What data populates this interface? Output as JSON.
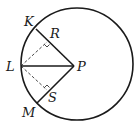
{
  "diagram": {
    "type": "geometry",
    "colors": {
      "stroke": "#1a1a1a",
      "background": "#ffffff"
    },
    "points": {
      "K": {
        "label": "K",
        "x": 36,
        "y": 29
      },
      "L": {
        "label": "L",
        "x": 21,
        "y": 66
      },
      "M": {
        "label": "M",
        "x": 37,
        "y": 103
      },
      "P": {
        "label": "P",
        "x": 74,
        "y": 66
      },
      "R": {
        "label": "R",
        "x": 47,
        "y": 44
      },
      "S": {
        "label": "S",
        "x": 47,
        "y": 89
      }
    },
    "circle": {
      "cx": 77,
      "cy": 64,
      "r": 56
    },
    "segments": [
      {
        "from": "K",
        "to": "P",
        "style": "solid"
      },
      {
        "from": "M",
        "to": "P",
        "style": "solid"
      },
      {
        "from": "L",
        "to": "P",
        "style": "solid"
      },
      {
        "from": "L",
        "to": "R",
        "style": "dashed"
      },
      {
        "from": "L",
        "to": "S",
        "style": "dashed"
      }
    ],
    "right_angles": [
      "R",
      "S"
    ]
  }
}
